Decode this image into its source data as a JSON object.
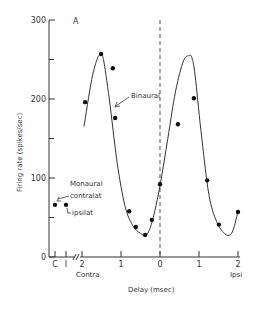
{
  "chart_data": {
    "type": "scatter",
    "panel_label": "A",
    "title": "",
    "xlabel": "Delay (msec)",
    "ylabel": "Firing rate (spikes/sec)",
    "ylim": [
      0,
      300
    ],
    "xlim": [
      -2,
      2
    ],
    "y_ticks": [
      0,
      100,
      200,
      300
    ],
    "y_minor_ticks": [
      50,
      150,
      250
    ],
    "x_ticks": [
      {
        "value": -2,
        "label": "2"
      },
      {
        "value": -1,
        "label": "1"
      },
      {
        "value": 0,
        "label": "0"
      },
      {
        "value": 1,
        "label": "1"
      },
      {
        "value": 2,
        "label": "2"
      }
    ],
    "x_side_labels": {
      "left": "Contra",
      "right": "Ipsi"
    },
    "monaural_ticks": [
      {
        "label": "C"
      },
      {
        "label": "I"
      }
    ],
    "grid": false,
    "reference_line": {
      "x": 0,
      "style": "dashed"
    },
    "series": [
      {
        "name": "Binaural",
        "kind": "points",
        "x": [
          -1.92,
          -1.51,
          -1.21,
          -1.15,
          -0.79,
          -0.62,
          -0.38,
          -0.21,
          0.0,
          0.46,
          0.87,
          1.21,
          1.51,
          2.0
        ],
        "y": [
          196,
          257,
          239,
          176,
          58,
          38,
          28,
          47,
          92,
          168,
          201,
          97,
          41,
          57
        ]
      },
      {
        "name": "Binaural fit",
        "kind": "curve",
        "x": [
          -1.95,
          -1.75,
          -1.6,
          -1.52,
          -1.45,
          -1.3,
          -1.1,
          -0.9,
          -0.7,
          -0.5,
          -0.35,
          -0.2,
          0.0,
          0.2,
          0.4,
          0.6,
          0.75,
          0.82,
          0.9,
          1.05,
          1.25,
          1.45,
          1.65,
          1.8,
          1.9,
          2.0
        ],
        "y": [
          165,
          225,
          252,
          255,
          250,
          200,
          120,
          65,
          40,
          30,
          28,
          45,
          90,
          150,
          210,
          248,
          255,
          252,
          230,
          160,
          80,
          45,
          30,
          28,
          38,
          58
        ]
      },
      {
        "name": "Monaural",
        "kind": "points",
        "points": [
          {
            "label": "contralat",
            "tick": "C",
            "y": 66
          },
          {
            "label": "ipsilat",
            "tick": "I",
            "y": 66
          }
        ]
      }
    ],
    "annotations": [
      {
        "text": "Binaural",
        "points_to": "curve"
      },
      {
        "text": "Monaural",
        "points_to": "monaural points"
      },
      {
        "text": "contralat",
        "points_to": "C point"
      },
      {
        "text": "ipsilat",
        "points_to": "I point"
      }
    ],
    "legend": null
  },
  "labels": {
    "panel": "A",
    "binaural": "Binaural",
    "monaural": "Monaural",
    "contralat": "contralat",
    "ipsilat": "ipsilat",
    "contra": "Contra",
    "ipsi": "Ipsi",
    "xlabel": "Delay (msec)",
    "ylabel": "Firing rate (spikes/sec)",
    "tick_c": "C",
    "tick_i": "I"
  },
  "style": {
    "ink": "#333333",
    "background": "#ffffff"
  }
}
